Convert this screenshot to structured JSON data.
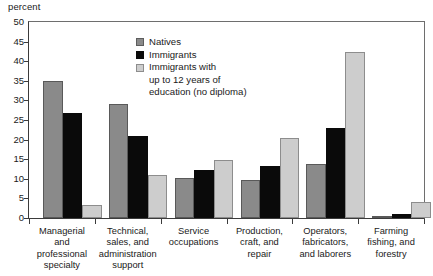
{
  "axis_unit_label": "percent",
  "legend": {
    "position": "inside-top-center",
    "entries": [
      {
        "label": "Natives",
        "color": "#8a8a8a"
      },
      {
        "label": "Immigrants",
        "color": "#0a0a0a"
      },
      {
        "label": "Immigrants  with",
        "color": "#cdcdcd"
      }
    ],
    "continuation_lines": [
      "up to 12 years of",
      "education (no diploma)"
    ]
  },
  "chart_data": {
    "type": "bar",
    "title": "",
    "subtitle": "",
    "xlabel": "",
    "ylabel": "percent",
    "ylim": [
      0,
      50
    ],
    "yticks": [
      0,
      5,
      10,
      15,
      20,
      25,
      30,
      35,
      40,
      45,
      50
    ],
    "ytick_labels": [
      "0",
      "5",
      "10",
      "15",
      "20",
      "25",
      "30",
      "35",
      "40",
      "45",
      "50"
    ],
    "grid": false,
    "legend_position": "inside-top-center",
    "categories": [
      "Managerial and professional specialty",
      "Technical, sales, and administration support",
      "Service occupations",
      "Production, craft, and repair",
      "Operators, fabricators, and laborers",
      "Farming fishing, and forestry"
    ],
    "category_label_lines": [
      [
        "Managerial",
        "and",
        "professional",
        "specialty"
      ],
      [
        "Technical,",
        "sales, and",
        "administration",
        "support"
      ],
      [
        "Service",
        "occupations"
      ],
      [
        "Production,",
        "craft, and",
        "repair"
      ],
      [
        "Operators,",
        "fabricators,",
        "and laborers"
      ],
      [
        "Farming",
        "fishing, and",
        "forestry"
      ]
    ],
    "series": [
      {
        "name": "Natives",
        "color": "#8a8a8a",
        "values": [
          35.0,
          29.2,
          10.2,
          9.7,
          13.9,
          0.3
        ]
      },
      {
        "name": "Immigrants",
        "color": "#0a0a0a",
        "values": [
          26.7,
          21.0,
          12.2,
          13.2,
          22.9,
          0.9
        ]
      },
      {
        "name": "Immigrants with up to 12 years of education (no diploma)",
        "color": "#cdcdcd",
        "values": [
          3.2,
          11.0,
          14.9,
          20.4,
          42.3,
          4.2
        ]
      }
    ]
  }
}
